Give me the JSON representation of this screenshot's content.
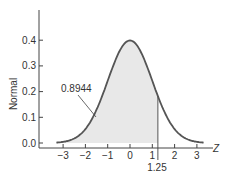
{
  "chart_data": {
    "type": "area",
    "title": "",
    "xlabel": "Z",
    "ylabel": "Normal",
    "xlim": [
      -3.3,
      3.3
    ],
    "ylim": [
      0.0,
      0.4
    ],
    "x_ticks": [
      "-3",
      "-2",
      "-1",
      "0",
      "1",
      "2",
      "3"
    ],
    "y_ticks": [
      "0.0",
      "0.1",
      "0.2",
      "0.3",
      "0.4"
    ],
    "grid": false,
    "legend": null,
    "series": [
      {
        "name": "Standard normal density",
        "distribution": "N(0,1)",
        "mean": 0,
        "sd": 1,
        "peak": 0.4
      }
    ],
    "shaded_region": {
      "from": "-inf",
      "to": 1.25,
      "area": 0.8944
    },
    "annotations": [
      {
        "text": "0.8944",
        "points_to": "shaded area"
      },
      {
        "text": "1.25",
        "position": "x-axis, below cutoff line"
      }
    ],
    "colors": {
      "curve": "#555555",
      "fill": "#e8e8e8",
      "axis": "#444444"
    }
  }
}
